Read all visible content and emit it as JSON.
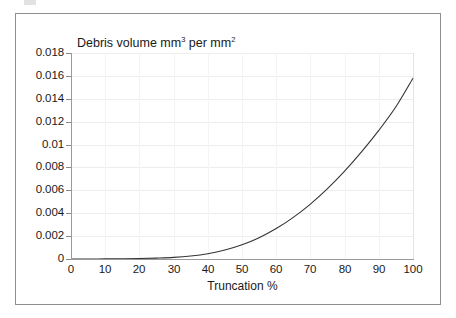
{
  "figure": {
    "background_color": "#ffffff",
    "frame_color": "#8e8e8e",
    "axis_color": "#9a9a9a",
    "grid_color": "#ededed",
    "curve_color": "#333333"
  },
  "chart_data": {
    "type": "line",
    "title": "Debris volume mm3 per mm2",
    "title_parts": {
      "lead": "Debris volume mm",
      "sup1": "3",
      "mid": " per mm",
      "sup2": "2"
    },
    "xlabel": "Truncation %",
    "ylabel": "",
    "xlim": [
      0,
      100
    ],
    "ylim": [
      0,
      0.018
    ],
    "grid": true,
    "legend": "none",
    "xticks": [
      0,
      10,
      20,
      30,
      40,
      50,
      60,
      70,
      80,
      90,
      100
    ],
    "xtick_labels": [
      "0",
      "10",
      "20",
      "30",
      "40",
      "50",
      "60",
      "70",
      "80",
      "90",
      "100"
    ],
    "yticks": [
      0,
      0.002,
      0.004,
      0.006,
      0.008,
      0.01,
      0.012,
      0.014,
      0.016,
      0.018
    ],
    "ytick_labels": [
      "0",
      "0.002",
      "0.004",
      "0.006",
      "0.008",
      "0.01",
      "0.012",
      "0.014",
      "0.016",
      "0.018"
    ],
    "series": [
      {
        "name": "Debris volume",
        "x": [
          0,
          5,
          10,
          15,
          20,
          25,
          30,
          35,
          40,
          45,
          50,
          55,
          60,
          65,
          70,
          75,
          80,
          85,
          90,
          95,
          100
        ],
        "values": [
          0.0,
          0.0,
          1e-05,
          2e-05,
          4e-05,
          8e-05,
          0.00014,
          0.00026,
          0.00046,
          0.00078,
          0.00124,
          0.00186,
          0.00266,
          0.00364,
          0.0048,
          0.00615,
          0.00768,
          0.00938,
          0.01124,
          0.0133,
          0.0158
        ]
      }
    ]
  }
}
